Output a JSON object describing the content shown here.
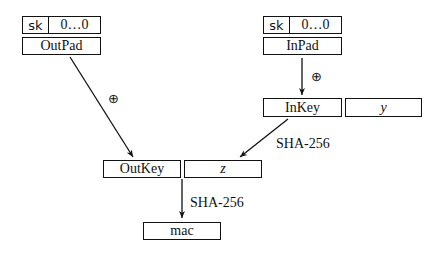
{
  "left_column": {
    "key_cell": "sk",
    "zeros_cell": "0…0",
    "pad": "OutPad",
    "op_symbol": "⊕"
  },
  "right_column": {
    "key_cell": "sk",
    "zeros_cell": "0…0",
    "pad": "InPad",
    "op_symbol": "⊕"
  },
  "inner_row": {
    "key": "InKey",
    "message": "y",
    "hash_label": "SHA-256"
  },
  "outer_row": {
    "key": "OutKey",
    "message": "z",
    "hash_label": "SHA-256"
  },
  "output": {
    "label": "mac"
  }
}
